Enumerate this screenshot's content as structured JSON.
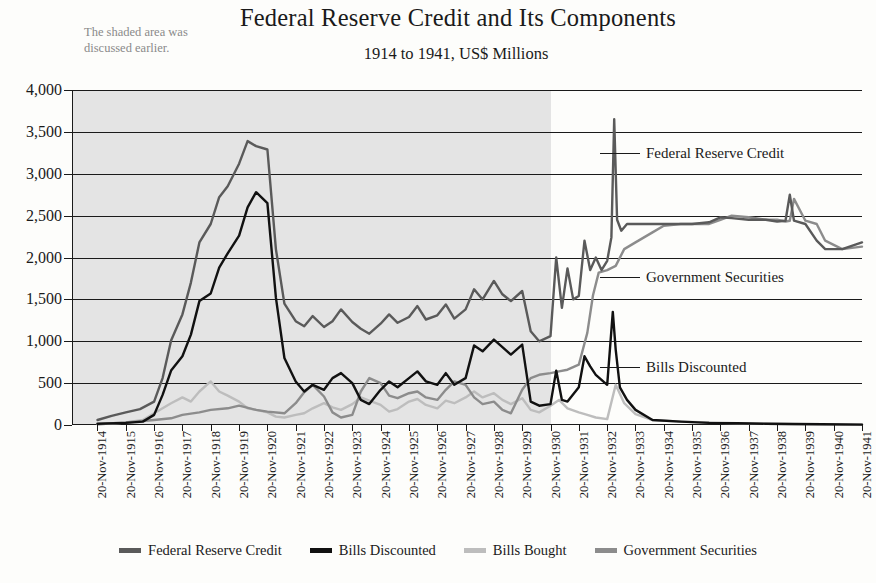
{
  "header": {
    "title": "Federal Reserve Credit and Its Components",
    "subtitle": "1914 to 1941, US$ Millions"
  },
  "annotation_note": "The shaded area was discussed earlier.",
  "callouts": [
    {
      "label": "Federal Reserve Credit"
    },
    {
      "label": "Government Securities"
    },
    {
      "label": "Bills Discounted"
    }
  ],
  "legend": {
    "items": [
      {
        "label": "Federal Reserve Credit",
        "color": "#5a5a5a"
      },
      {
        "label": "Bills Discounted",
        "color": "#111111"
      },
      {
        "label": "Bills Bought",
        "color": "#bdbdbd"
      },
      {
        "label": "Government Securities",
        "color": "#8c8c8c"
      }
    ]
  },
  "chart_data": {
    "type": "line",
    "title": "Federal Reserve Credit and Its Components",
    "subtitle": "1914 to 1941, US$ Millions",
    "xlabel": "",
    "ylabel": "US$ Millions",
    "ylim": [
      0,
      4000
    ],
    "ytick_values": [
      0,
      500,
      1000,
      1500,
      2000,
      2500,
      3000,
      3500,
      4000
    ],
    "ytick_labels": [
      "0",
      "500",
      "1,000",
      "1,500",
      "2,000",
      "2,500",
      "3,000",
      "3,500",
      "4,000"
    ],
    "grid": true,
    "legend_position": "bottom",
    "xtick_labels": [
      "20-Nov-1914",
      "20-Nov-1915",
      "20-Nov-1916",
      "20-Nov-1917",
      "20-Nov-1918",
      "20-Nov-1919",
      "20-Nov-1920",
      "20-Nov-1921",
      "20-Nov-1922",
      "20-Nov-1923",
      "20-Nov-1924",
      "20-Nov-1925",
      "20-Nov-1926",
      "20-Nov-1927",
      "20-Nov-1928",
      "20-Nov-1929",
      "20-Nov-1930",
      "20-Nov-1931",
      "20-Nov-1932",
      "20-Nov-1933",
      "20-Nov-1934",
      "20-Nov-1935",
      "20-Nov-1936",
      "20-Nov-1937",
      "20-Nov-1938",
      "20-Nov-1939",
      "20-Nov-1940",
      "20-Nov-1941"
    ],
    "shaded_region": {
      "from": "20-Nov-1914",
      "to": "20-Nov-1930",
      "color": "#e4e4e4"
    },
    "x_start_year": 1914,
    "x_end_year": 1941,
    "series": [
      {
        "name": "Federal Reserve Credit",
        "color": "#5a5a5a",
        "x": [
          1914.9,
          1915.4,
          1915.9,
          1916.4,
          1916.9,
          1917.2,
          1917.5,
          1917.9,
          1918.2,
          1918.5,
          1918.9,
          1919.2,
          1919.5,
          1919.9,
          1920.2,
          1920.5,
          1920.9,
          1921.2,
          1921.5,
          1921.9,
          1922.2,
          1922.5,
          1922.9,
          1923.2,
          1923.5,
          1923.9,
          1924.2,
          1924.5,
          1924.9,
          1925.2,
          1925.5,
          1925.9,
          1926.2,
          1926.5,
          1926.9,
          1927.2,
          1927.5,
          1927.9,
          1928.2,
          1928.5,
          1928.9,
          1929.2,
          1929.5,
          1929.9,
          1930.2,
          1930.5,
          1930.9,
          1931.1,
          1931.3,
          1931.5,
          1931.7,
          1931.9,
          1932.1,
          1932.3,
          1932.5,
          1932.7,
          1932.9,
          1933.05,
          1933.15,
          1933.25,
          1933.4,
          1933.6,
          1933.9,
          1934.3,
          1934.9,
          1935.5,
          1935.9,
          1936.5,
          1936.9,
          1937.3,
          1937.9,
          1938.5,
          1938.9,
          1939.2,
          1939.35,
          1939.5,
          1939.9,
          1940.3,
          1940.6,
          1941.2,
          1941.9
        ],
        "y": [
          60,
          110,
          150,
          190,
          280,
          560,
          1010,
          1320,
          1700,
          2180,
          2400,
          2720,
          2850,
          3120,
          3390,
          3330,
          3290,
          2100,
          1450,
          1240,
          1180,
          1300,
          1170,
          1240,
          1380,
          1230,
          1150,
          1090,
          1210,
          1320,
          1220,
          1290,
          1420,
          1260,
          1310,
          1440,
          1270,
          1380,
          1620,
          1500,
          1720,
          1560,
          1480,
          1600,
          1120,
          1000,
          1060,
          2000,
          1400,
          1870,
          1500,
          1540,
          2200,
          1850,
          2000,
          1850,
          1960,
          2240,
          3650,
          2450,
          2320,
          2400,
          2400,
          2400,
          2400,
          2400,
          2400,
          2420,
          2480,
          2470,
          2450,
          2450,
          2430,
          2440,
          2750,
          2440,
          2400,
          2200,
          2100,
          2100,
          2180
        ]
      },
      {
        "name": "Bills Discounted",
        "color": "#111111",
        "x": [
          1914.9,
          1915.9,
          1916.5,
          1916.9,
          1917.2,
          1917.5,
          1917.9,
          1918.2,
          1918.5,
          1918.9,
          1919.2,
          1919.5,
          1919.9,
          1920.2,
          1920.5,
          1920.9,
          1921.2,
          1921.5,
          1921.9,
          1922.2,
          1922.5,
          1922.9,
          1923.2,
          1923.5,
          1923.9,
          1924.2,
          1924.5,
          1924.9,
          1925.2,
          1925.5,
          1925.9,
          1926.2,
          1926.5,
          1926.9,
          1927.2,
          1927.5,
          1927.9,
          1928.2,
          1928.5,
          1928.9,
          1929.2,
          1929.5,
          1929.9,
          1930.2,
          1930.5,
          1930.9,
          1931.1,
          1931.3,
          1931.5,
          1931.9,
          1932.1,
          1932.3,
          1932.5,
          1932.9,
          1933.1,
          1933.2,
          1933.35,
          1933.6,
          1933.9,
          1934.5,
          1935.5,
          1936.5,
          1937.5,
          1938.5,
          1939.5,
          1940.5,
          1941.9
        ],
        "y": [
          15,
          25,
          40,
          120,
          360,
          650,
          820,
          1080,
          1480,
          1570,
          1880,
          2050,
          2260,
          2600,
          2780,
          2650,
          1520,
          800,
          520,
          400,
          480,
          420,
          560,
          620,
          500,
          300,
          250,
          420,
          520,
          450,
          560,
          640,
          520,
          480,
          620,
          480,
          560,
          950,
          880,
          1020,
          930,
          840,
          960,
          280,
          230,
          250,
          650,
          300,
          280,
          450,
          820,
          700,
          600,
          480,
          1350,
          900,
          450,
          300,
          180,
          60,
          40,
          25,
          20,
          15,
          12,
          8,
          5
        ]
      },
      {
        "name": "Bills Bought",
        "color": "#bdbdbd",
        "x": [
          1914.9,
          1915.9,
          1916.5,
          1916.9,
          1917.5,
          1917.9,
          1918.2,
          1918.5,
          1918.9,
          1919.2,
          1919.5,
          1919.9,
          1920.2,
          1920.5,
          1920.9,
          1921.2,
          1921.5,
          1921.9,
          1922.2,
          1922.5,
          1922.9,
          1923.2,
          1923.5,
          1923.9,
          1924.2,
          1924.5,
          1924.9,
          1925.2,
          1925.5,
          1925.9,
          1926.2,
          1926.5,
          1926.9,
          1927.2,
          1927.5,
          1927.9,
          1928.2,
          1928.5,
          1928.9,
          1929.2,
          1929.5,
          1929.9,
          1930.2,
          1930.5,
          1930.9,
          1931.2,
          1931.5,
          1931.9,
          1932.2,
          1932.5,
          1932.9,
          1933.2,
          1933.5,
          1933.9,
          1934.5,
          1935.5,
          1936.5,
          1937.5,
          1938.5,
          1939.5,
          1940.5,
          1941.9
        ],
        "y": [
          10,
          30,
          60,
          140,
          260,
          330,
          280,
          400,
          520,
          400,
          350,
          280,
          200,
          180,
          150,
          100,
          90,
          120,
          140,
          200,
          260,
          210,
          180,
          250,
          330,
          290,
          240,
          160,
          190,
          280,
          310,
          240,
          200,
          290,
          260,
          330,
          400,
          330,
          380,
          300,
          250,
          320,
          180,
          150,
          230,
          300,
          200,
          150,
          120,
          90,
          70,
          480,
          260,
          130,
          60,
          40,
          30,
          20,
          15,
          10,
          8,
          6
        ]
      },
      {
        "name": "Government Securities",
        "color": "#8c8c8c",
        "x": [
          1914.9,
          1915.9,
          1916.9,
          1917.5,
          1917.9,
          1918.5,
          1918.9,
          1919.5,
          1919.9,
          1920.5,
          1920.9,
          1921.5,
          1921.9,
          1922.2,
          1922.5,
          1922.9,
          1923.2,
          1923.5,
          1923.9,
          1924.2,
          1924.5,
          1924.9,
          1925.2,
          1925.5,
          1925.9,
          1926.2,
          1926.5,
          1926.9,
          1927.2,
          1927.5,
          1927.9,
          1928.2,
          1928.5,
          1928.9,
          1929.2,
          1929.5,
          1929.9,
          1930.2,
          1930.5,
          1930.9,
          1931.2,
          1931.5,
          1931.9,
          1932.2,
          1932.4,
          1932.6,
          1932.9,
          1933.2,
          1933.5,
          1933.9,
          1934.5,
          1934.9,
          1935.5,
          1935.9,
          1936.5,
          1936.9,
          1937.3,
          1937.9,
          1938.5,
          1938.9,
          1939.2,
          1939.35,
          1939.5,
          1939.9,
          1940.3,
          1940.6,
          1941.2,
          1941.9
        ],
        "y": [
          10,
          30,
          60,
          80,
          120,
          150,
          180,
          200,
          230,
          180,
          160,
          140,
          260,
          390,
          480,
          340,
          150,
          90,
          120,
          400,
          560,
          500,
          350,
          320,
          380,
          400,
          330,
          300,
          420,
          520,
          480,
          330,
          250,
          280,
          180,
          140,
          420,
          560,
          600,
          620,
          640,
          660,
          720,
          1100,
          1550,
          1820,
          1850,
          1900,
          2100,
          2180,
          2300,
          2380,
          2400,
          2400,
          2400,
          2450,
          2500,
          2480,
          2450,
          2450,
          2430,
          2440,
          2700,
          2440,
          2400,
          2200,
          2100,
          2130
        ]
      }
    ]
  }
}
